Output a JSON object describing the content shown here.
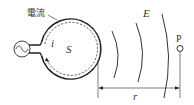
{
  "diagram": {
    "labels": {
      "current": "電流",
      "current_symbol": "i",
      "area": "S",
      "field": "E",
      "point": "P",
      "distance": "r"
    },
    "elements": [
      {
        "id": "ac-source",
        "type": "ac-source-symbol"
      },
      {
        "id": "loop",
        "type": "circular-loop",
        "style": "solid"
      },
      {
        "id": "current-path",
        "type": "dashed-circle-with-arrow"
      },
      {
        "id": "wavefronts",
        "type": "arcs",
        "count": 3
      },
      {
        "id": "point-p",
        "type": "small-circle-marker"
      },
      {
        "id": "distance-r",
        "type": "double-arrow-dimension"
      }
    ],
    "colors": {
      "stroke": "#333333",
      "background": "#ffffff"
    }
  }
}
